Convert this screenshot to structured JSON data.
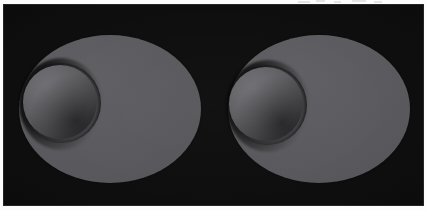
{
  "figure": {
    "caption": "",
    "frame": {
      "plate_color": "#0a0a0b",
      "page_color": "#fdfdfd",
      "left": 3,
      "top": 4,
      "width": 421,
      "height": 202
    }
  },
  "palette": {
    "background": "#0a0a0b",
    "disc_base": "#58585c",
    "disc_highlight": "#5d5d61",
    "disc_shadow": "#4b4b4f",
    "sphere_highlight": "#6e6e72",
    "sphere_midtone": "#5c5c60",
    "sphere_terminator": "#3a3a3e",
    "sphere_limb": "#161618",
    "cast_shadow": "#000000",
    "page": "#fdfdfd"
  },
  "scenes": [
    {
      "id": "scene-left",
      "label": "",
      "disc": {
        "shape": "ellipse",
        "center_x": 107,
        "center_y": 105,
        "radius_x": 91,
        "radius_y": 74,
        "fill": "#58585c"
      },
      "sphere": {
        "shape": "sphere",
        "center_x": 57,
        "center_y": 98,
        "radius": 37,
        "fill": "#5c5c60",
        "light_direction": "upper-left"
      },
      "shadow": {
        "shape": "ellipse",
        "center_x": 58,
        "center_y": 100,
        "radius_x": 42,
        "radius_y": 46,
        "opacity": 0.92
      }
    },
    {
      "id": "scene-right",
      "label": "",
      "disc": {
        "shape": "ellipse",
        "center_x": 316,
        "center_y": 105,
        "radius_x": 91,
        "radius_y": 74,
        "fill": "#58585c"
      },
      "sphere": {
        "shape": "sphere",
        "center_x": 263,
        "center_y": 100,
        "radius": 37,
        "fill": "#5c5c60",
        "light_direction": "upper-left"
      },
      "shadow": {
        "shape": "ellipse",
        "center_x": 265,
        "center_y": 102,
        "radius_x": 42,
        "radius_y": 46,
        "opacity": 0.92
      }
    }
  ],
  "scan_specks": [
    {
      "left": 298,
      "top": 1,
      "width": 12,
      "height": 2
    },
    {
      "left": 316,
      "top": 0,
      "width": 9,
      "height": 2
    },
    {
      "left": 334,
      "top": 1,
      "width": 7,
      "height": 2
    },
    {
      "left": 352,
      "top": 0,
      "width": 14,
      "height": 2
    },
    {
      "left": 374,
      "top": 1,
      "width": 8,
      "height": 2
    }
  ]
}
